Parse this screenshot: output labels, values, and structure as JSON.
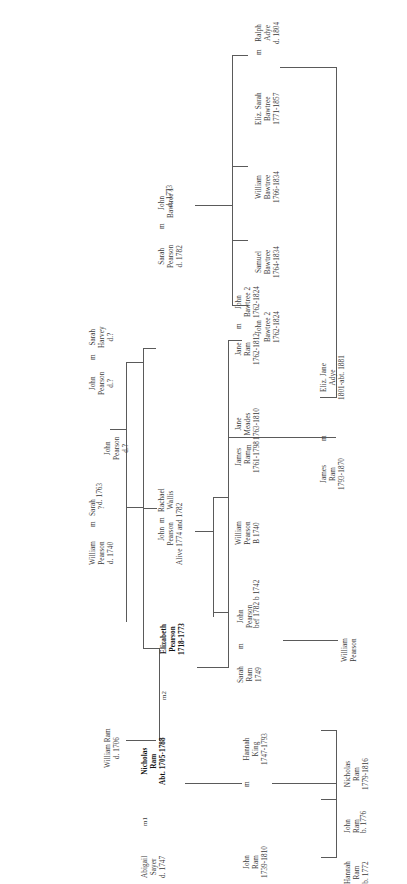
{
  "document": {
    "type": "genealogical-family-tree",
    "orientation": "rotated-90-ccw",
    "surnames": [
      "Pearson",
      "Bawtree",
      "Ram",
      "Adye",
      "Sayer",
      "King",
      "Meades",
      "Harvey",
      "Wallis"
    ],
    "line_color": "#5a5a5a",
    "text_color": "#3a3a3a",
    "background": "#ffffff"
  },
  "people": {
    "john_pearson_root": {
      "name_line1": "John",
      "name_line2": "Pearson",
      "dates": "d.?"
    },
    "william_pearson_1740": {
      "name_line1": "William",
      "name_line2": "Pearson",
      "dates": "d. 1740",
      "marriage": "m",
      "spouse_line1": "Sarah",
      "spouse_line2": "?",
      "spouse_dates": "d. 1763"
    },
    "john_pearson_q": {
      "name_line1": "John",
      "name_line2": "Pearson",
      "dates": "d.?",
      "marriage": "m",
      "spouse_line1": "Sarah",
      "spouse_line2": "Harvey",
      "spouse_dates": "d.?"
    },
    "sarah_pearson_1782": {
      "name_line1": "Sarah",
      "name_line2": "Pearson",
      "dates": "d. 1782",
      "marriage": "m",
      "spouse_line1": "John",
      "spouse_line2": "Bawtree 1",
      "spouse_dates": "d. 1773"
    },
    "eliz_sarah_bawtree": {
      "name_line1": "Eliz. Sarah",
      "name_line2": "Bawtree",
      "dates": "1771-1857",
      "marriage": "m",
      "spouse_line1": "Ralph",
      "spouse_line2": "Adye",
      "spouse_dates": "d. 1804"
    },
    "william_bawtree": {
      "name_line1": "William",
      "name_line2": "Bawtree",
      "dates": "1766-1834"
    },
    "samuel_bawtree": {
      "name_line1": "Samuel",
      "name_line2": "Bawtree",
      "dates": "1764-1834"
    },
    "john_bawtree_2": {
      "name_line1": "John",
      "name_line2": "Bawtree 2",
      "dates": "1762-1824"
    },
    "jane_ram_1762": {
      "name_line1": "Jane",
      "name_line2": "Ram",
      "dates": "1762-1812",
      "marriage": "m",
      "spouse_line1": "John",
      "spouse_line2": "Bawtree 2",
      "spouse_dates": "1762-1824"
    },
    "eliz_jane_adye": {
      "name_line1": "Eliz. Jane",
      "name_line2": "Adye",
      "dates": "1801-abt. 1881"
    },
    "james_ram_1793": {
      "name_line1": "James",
      "name_line2": "Ram",
      "dates": "1793-1870",
      "marriage": "m"
    },
    "james_ram_1761": {
      "name_line1": "James",
      "name_line2": "Ram",
      "dates": "1761-1798",
      "marriage": "m",
      "spouse_line1": "Jane",
      "spouse_line2": "Meades",
      "spouse_dates": "1763-1810"
    },
    "john_pearson_rachael": {
      "name_line1": "John",
      "name_line2": "Pearson",
      "dates": "Alive 1774 and 1782",
      "marriage": "m",
      "spouse_line1": "Rachael",
      "spouse_line2": "Wallis"
    },
    "william_pearson_b1740": {
      "name_line1": "William",
      "name_line2": "Pearson",
      "dates": "B 1740"
    },
    "elizabeth_pearson": {
      "name_line1": "Elizabeth",
      "name_line2": "Pearson",
      "dates": "1718-1773",
      "bold": true
    },
    "sarah_ram_1749": {
      "name_line1": "Sarah",
      "name_line2": "Ram",
      "dates": "1749",
      "marriage": "m",
      "spouse_line1": "John",
      "spouse_line2": "Pearson",
      "spouse_dates": "bef 1782  b 1742"
    },
    "william_pearson_child": {
      "name_line1": "William",
      "name_line2": "Pearson"
    },
    "william_ram_1706": {
      "name_line1": "William Ram",
      "dates": "d. 1706"
    },
    "nicholas_ram": {
      "name_line1": "Nicholas",
      "name_line2": "Ram",
      "dates": "Abt. 1705-1788",
      "bold": true
    },
    "abigail_sayer": {
      "name_line1": "Abigail",
      "name_line2": "Sayer",
      "dates": "d. 1747"
    },
    "hannah_king": {
      "name_line1": "Hannah",
      "name_line2": "King",
      "dates": "1747-1793"
    },
    "john_ram_1739": {
      "name_line1": "John",
      "name_line2": "Ram",
      "dates": "1739-1810",
      "marriage": "m"
    },
    "nicholas_ram_1779": {
      "name_line1": "Nicholas",
      "name_line2": "Ram",
      "dates": "1779-1816"
    },
    "john_ram_1776": {
      "name_line1": "John",
      "name_line2": "Ram",
      "dates": "b. 1776"
    },
    "hannah_ram_1772": {
      "name_line1": "Hannah",
      "name_line2": "Ram",
      "dates": "b. 1772"
    }
  },
  "markers": {
    "m1": "m1",
    "m2": "m2"
  }
}
